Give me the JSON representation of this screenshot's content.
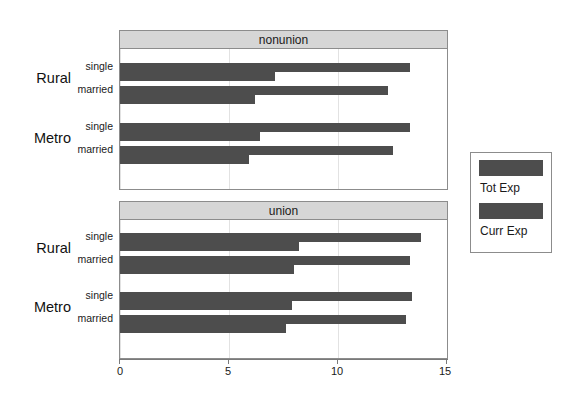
{
  "chart_data": {
    "type": "bar",
    "orientation": "horizontal",
    "title": "",
    "xlabel": "",
    "ylabel": "",
    "xlim": [
      0,
      15
    ],
    "xticks": [
      0,
      5,
      10,
      15
    ],
    "xtick_labels": [
      "0",
      "5",
      "10",
      "15"
    ],
    "grid": true,
    "legend_position": "right",
    "panel_variable": "union status",
    "panels": [
      {
        "label": "nonunion",
        "groups": [
          {
            "outer": "Rural",
            "inner": "single",
            "values": {
              "Tot Exp": 13.3,
              "Curr Exp": 7.1
            }
          },
          {
            "outer": "Rural",
            "inner": "married",
            "values": {
              "Tot Exp": 12.3,
              "Curr Exp": 6.2
            }
          },
          {
            "outer": "Metro",
            "inner": "single",
            "values": {
              "Tot Exp": 13.3,
              "Curr Exp": 6.4
            }
          },
          {
            "outer": "Metro",
            "inner": "married",
            "values": {
              "Tot Exp": 12.5,
              "Curr Exp": 5.9
            }
          }
        ]
      },
      {
        "label": "union",
        "groups": [
          {
            "outer": "Rural",
            "inner": "single",
            "values": {
              "Tot Exp": 13.8,
              "Curr Exp": 8.2
            }
          },
          {
            "outer": "Rural",
            "inner": "married",
            "values": {
              "Tot Exp": 13.3,
              "Curr Exp": 8.0
            }
          },
          {
            "outer": "Metro",
            "inner": "single",
            "values": {
              "Tot Exp": 13.4,
              "Curr Exp": 7.9
            }
          },
          {
            "outer": "Metro",
            "inner": "married",
            "values": {
              "Tot Exp": 13.1,
              "Curr Exp": 7.6
            }
          }
        ]
      }
    ],
    "series": [
      {
        "name": "Tot Exp",
        "color": "#4d4d4d"
      },
      {
        "name": "Curr Exp",
        "color": "#4d4d4d"
      }
    ]
  },
  "legend": {
    "entries": [
      {
        "label": "Tot Exp",
        "color": "#4d4d4d"
      },
      {
        "label": "Curr Exp",
        "color": "#4d4d4d"
      }
    ]
  },
  "colors": {
    "bar": "#4d4d4d",
    "strip_background": "#d6d6d6",
    "border": "#8c8c8c",
    "gridline": "#e2e2e2",
    "plot_background": "#ffffff"
  }
}
